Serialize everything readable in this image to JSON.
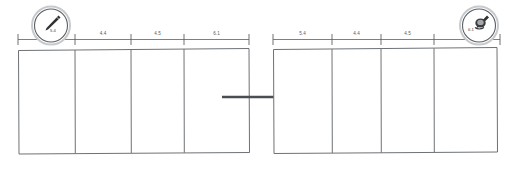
{
  "drawing": {
    "title": "Bay dimension comparison diagram",
    "background_color": "#ffffff",
    "line_color": "#6e7276",
    "dim_line_color": "#5d6165",
    "text_color": "#55585c",
    "arrow_color": "#4a4d51",
    "badge_ring_color": "#9a9ea2"
  },
  "left_diagram": {
    "name": "existing-bay-layout",
    "dimension_line": {
      "segments": [
        {
          "label": "5.4",
          "value": 5.4,
          "has_badge": true
        },
        {
          "label": "4.4",
          "value": 4.4,
          "has_badge": false
        },
        {
          "label": "4.5",
          "value": 4.5,
          "has_badge": false
        },
        {
          "label": "6.1",
          "value": 6.1,
          "has_badge": false
        }
      ]
    },
    "badge": {
      "label": "5.4",
      "icon": "pen-marker-icon",
      "position": "segment-1"
    },
    "cells": 4
  },
  "right_diagram": {
    "name": "proposed-bay-layout",
    "dimension_line": {
      "segments": [
        {
          "label": "5.4",
          "value": 5.4,
          "has_badge": false
        },
        {
          "label": "4.4",
          "value": 4.4,
          "has_badge": false
        },
        {
          "label": "4.5",
          "value": 4.5,
          "has_badge": false
        },
        {
          "label": "6.1",
          "value": 6.1,
          "has_badge": true
        }
      ]
    },
    "badge": {
      "label": "6.1",
      "icon": "scribble-marker-icon",
      "position": "segment-4"
    },
    "cells": 4
  },
  "transform_arrow": {
    "name": "transformation-arrow",
    "direction": "right",
    "label": ""
  }
}
